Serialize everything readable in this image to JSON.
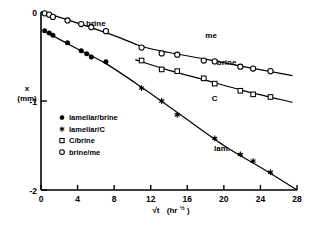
{
  "chart_data": {
    "type": "scatter",
    "title": "",
    "xlabel": "√t  (hr½)",
    "xlabel_main": "√t",
    "xlabel_units": "(hr",
    "xlabel_exp": "½",
    "xlabel_close": ")",
    "ylabel_line1": "x",
    "ylabel_line2": "(mm)",
    "xlim": [
      0,
      28
    ],
    "ylim": [
      -2,
      0
    ],
    "xticks": [
      0,
      4,
      8,
      12,
      16,
      20,
      24,
      28
    ],
    "xticklabels": [
      "0",
      "4",
      "8",
      "12",
      "16",
      "20",
      "24",
      "28"
    ],
    "yticks": [
      0,
      -1,
      -2
    ],
    "yticklabels": [
      "0",
      "-1",
      "-2"
    ],
    "grid": false,
    "legend_position": "inside-left-lower",
    "series": [
      {
        "name": "lamellar/brine",
        "marker": "filled-circle",
        "color": "#000000",
        "points": [
          {
            "x": 0.4,
            "y": -0.21
          },
          {
            "x": 0.9,
            "y": -0.235
          },
          {
            "x": 1.3,
            "y": -0.26
          },
          {
            "x": 2.9,
            "y": -0.345
          },
          {
            "x": 4.4,
            "y": -0.435
          },
          {
            "x": 5.0,
            "y": -0.47
          },
          {
            "x": 5.5,
            "y": -0.505
          },
          {
            "x": 7.1,
            "y": -0.56
          }
        ]
      },
      {
        "name": "lamellar/C",
        "marker": "star",
        "color": "#000000",
        "points": [
          {
            "x": 11.0,
            "y": -0.855
          },
          {
            "x": 13.2,
            "y": -1.0
          },
          {
            "x": 14.9,
            "y": -1.155
          },
          {
            "x": 19.0,
            "y": -1.42
          },
          {
            "x": 21.8,
            "y": -1.6
          },
          {
            "x": 23.2,
            "y": -1.675
          },
          {
            "x": 25.1,
            "y": -1.8
          }
        ]
      },
      {
        "name": "C/brine",
        "marker": "open-square",
        "color": "#000000",
        "points": [
          {
            "x": 11.0,
            "y": -0.545
          },
          {
            "x": 13.2,
            "y": -0.645
          },
          {
            "x": 14.9,
            "y": -0.665
          },
          {
            "x": 17.8,
            "y": -0.745
          },
          {
            "x": 19.0,
            "y": -0.805
          },
          {
            "x": 21.8,
            "y": -0.885
          },
          {
            "x": 23.2,
            "y": -0.925
          },
          {
            "x": 25.1,
            "y": -0.955
          }
        ]
      },
      {
        "name": "brine/me",
        "marker": "open-circle",
        "color": "#000000",
        "points": [
          {
            "x": 0.4,
            "y": -0.015
          },
          {
            "x": 0.9,
            "y": -0.03
          },
          {
            "x": 1.3,
            "y": -0.055
          },
          {
            "x": 2.9,
            "y": -0.095
          },
          {
            "x": 4.4,
            "y": -0.135
          },
          {
            "x": 5.5,
            "y": -0.17
          },
          {
            "x": 7.1,
            "y": -0.215
          },
          {
            "x": 11.0,
            "y": -0.4
          },
          {
            "x": 13.2,
            "y": -0.465
          },
          {
            "x": 14.9,
            "y": -0.48
          },
          {
            "x": 17.8,
            "y": -0.545
          },
          {
            "x": 19.0,
            "y": -0.555
          },
          {
            "x": 21.8,
            "y": -0.615
          },
          {
            "x": 23.2,
            "y": -0.635
          },
          {
            "x": 25.1,
            "y": -0.665
          }
        ]
      }
    ],
    "fit_curves": [
      {
        "name": "brine/me-curve",
        "points": [
          {
            "x": 0.2,
            "y": 0.0
          },
          {
            "x": 4.0,
            "y": -0.125
          },
          {
            "x": 8.0,
            "y": -0.265
          },
          {
            "x": 11.0,
            "y": -0.385
          },
          {
            "x": 14.0,
            "y": -0.455
          },
          {
            "x": 18.0,
            "y": -0.53
          },
          {
            "x": 22.0,
            "y": -0.61
          },
          {
            "x": 27.5,
            "y": -0.715
          }
        ]
      },
      {
        "name": "C/brine-curve",
        "points": [
          {
            "x": 10.3,
            "y": -0.535
          },
          {
            "x": 14.0,
            "y": -0.655
          },
          {
            "x": 18.0,
            "y": -0.765
          },
          {
            "x": 22.0,
            "y": -0.88
          },
          {
            "x": 27.5,
            "y": -1.015
          }
        ]
      },
      {
        "name": "lamellar-curve",
        "points": [
          {
            "x": 0.25,
            "y": -0.21
          },
          {
            "x": 4.0,
            "y": -0.415
          },
          {
            "x": 7.1,
            "y": -0.58
          },
          {
            "x": 11.0,
            "y": -0.845
          },
          {
            "x": 15.0,
            "y": -1.135
          },
          {
            "x": 20.0,
            "y": -1.5
          },
          {
            "x": 24.0,
            "y": -1.745
          },
          {
            "x": 28.0,
            "y": -2.0
          }
        ]
      }
    ],
    "region_labels": [
      {
        "id": "brine-upper",
        "text": "brine",
        "x": 6.0,
        "y": -0.16
      },
      {
        "id": "me",
        "text": "me",
        "x": 18.6,
        "y": -0.29
      },
      {
        "id": "brine-mid",
        "text": "brine",
        "x": 20.3,
        "y": -0.595
      },
      {
        "id": "c",
        "text": "C",
        "x": 19.0,
        "y": -1.0
      },
      {
        "id": "lam",
        "text": "lam.",
        "x": 19.8,
        "y": -1.565
      }
    ],
    "legend": [
      {
        "marker": "filled-circle",
        "label": "lamellar/brine"
      },
      {
        "marker": "star",
        "label": "lamellar/C"
      },
      {
        "marker": "open-square",
        "label": "C/brine"
      },
      {
        "marker": "open-circle",
        "label": "brine/me"
      }
    ]
  }
}
